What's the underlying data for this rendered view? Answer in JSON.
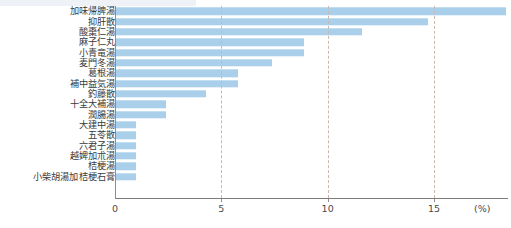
{
  "chart_data": {
    "type": "bar",
    "orientation": "horizontal",
    "title": "",
    "xlabel": "(%)",
    "ylabel": "",
    "xlim": [
      0,
      18.8
    ],
    "grid": true,
    "grid_axis": "x",
    "legend": "none",
    "bar_color": "#a9cfeb",
    "axis_color": "#8d8d8d",
    "gridline_color": "#c9b8b0",
    "xticks": [
      0,
      5,
      10,
      15
    ],
    "xtick_labels": [
      "0",
      "5",
      "10",
      "15"
    ],
    "unit": "(%)",
    "categories": [
      "加味帰脾湯",
      "抑肝散",
      "酸棗仁湯",
      "麻子仁丸",
      "小青竜湯",
      "麦門冬湯",
      "葛根湯",
      "補中益気湯",
      "釣藤散",
      "十全大補湯",
      "潤腸湯",
      "大建中湯",
      "五苓散",
      "六君子湯",
      "越婢加朮湯",
      "桔梗湯",
      "小柴胡湯加桔梗石膏"
    ],
    "values": [
      18.4,
      14.7,
      11.6,
      8.9,
      8.9,
      7.4,
      5.8,
      5.8,
      4.3,
      2.4,
      2.4,
      1.0,
      1.0,
      1.0,
      1.0,
      1.0,
      1.0
    ]
  }
}
